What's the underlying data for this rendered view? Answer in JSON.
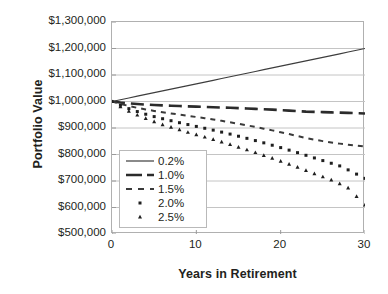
{
  "chart_data": {
    "type": "line",
    "title": "",
    "xlabel": "Years in Retirement",
    "ylabel": "Portfolio Value",
    "xlim": [
      0,
      30
    ],
    "ylim": [
      500000,
      1300000
    ],
    "xticks": [
      "0",
      "10",
      "20",
      "30"
    ],
    "xtick_values": [
      0,
      10,
      20,
      30
    ],
    "yticks": [
      "$500,000",
      "$600,000",
      "$700,000",
      "$800,000",
      "$900,000",
      "$1,000,000",
      "$1,100,000",
      "$1,200,000",
      "$1,300,000"
    ],
    "ytick_values": [
      500000,
      600000,
      700000,
      800000,
      900000,
      1000000,
      1100000,
      1200000,
      1300000
    ],
    "grid": "horizontal",
    "legend_position": "lower-left-inside",
    "x": [
      0,
      1,
      2,
      3,
      4,
      5,
      6,
      7,
      8,
      9,
      10,
      11,
      12,
      13,
      14,
      15,
      16,
      17,
      18,
      19,
      20,
      21,
      22,
      23,
      24,
      25,
      26,
      27,
      28,
      29,
      30
    ],
    "series": [
      {
        "name": "0.2%",
        "style": "solid",
        "color": "#3d3d3d",
        "start_value": 1000000,
        "end_value": 1200000,
        "values": [
          1000000,
          1006700,
          1013300,
          1020000,
          1026700,
          1033300,
          1040000,
          1046700,
          1053300,
          1060000,
          1066700,
          1073300,
          1080000,
          1086700,
          1093300,
          1100000,
          1106700,
          1113300,
          1120000,
          1126700,
          1133300,
          1140000,
          1146700,
          1153300,
          1160000,
          1166700,
          1173300,
          1180000,
          1186700,
          1193300,
          1200000
        ]
      },
      {
        "name": "1.0%",
        "style": "long-dash",
        "color": "#2b2b2b",
        "start_value": 1000000,
        "end_value": 955000,
        "values": [
          1000000,
          996000,
          993000,
          990500,
          988500,
          986800,
          985300,
          984000,
          982800,
          981700,
          980600,
          979500,
          978400,
          977300,
          976200,
          975000,
          973700,
          972300,
          970800,
          969200,
          967500,
          965700,
          963800,
          961800,
          961000,
          960000,
          959000,
          958000,
          957000,
          956000,
          955000
        ]
      },
      {
        "name": "1.5%",
        "style": "short-dash",
        "color": "#3a3a3a",
        "start_value": 1000000,
        "end_value": 830000,
        "values": [
          1000000,
          991000,
          983000,
          976000,
          970000,
          964500,
          959500,
          955000,
          950500,
          946000,
          941500,
          937000,
          932000,
          927000,
          921500,
          916000,
          910000,
          904000,
          897500,
          891000,
          884000,
          877000,
          869500,
          862000,
          856000,
          850500,
          845500,
          841000,
          837000,
          833500,
          830000
        ]
      },
      {
        "name": "2.0%",
        "style": "dotted-square",
        "color": "#1f1f1f",
        "start_value": 1000000,
        "end_value": 710000,
        "values": [
          1000000,
          986000,
          973000,
          962000,
          952000,
          943000,
          935000,
          927500,
          920000,
          913000,
          906000,
          899000,
          892000,
          884500,
          877000,
          869000,
          861000,
          852500,
          844000,
          835000,
          826000,
          816500,
          807000,
          797000,
          787000,
          777000,
          767000,
          757000,
          742000,
          726000,
          710000
        ]
      },
      {
        "name": "2.5%",
        "style": "dotted-triangle",
        "color": "#1f1f1f",
        "start_value": 1000000,
        "end_value": 610000,
        "values": [
          1000000,
          981000,
          964000,
          949000,
          936000,
          924000,
          913000,
          903000,
          893500,
          884000,
          875000,
          866000,
          857000,
          847500,
          838000,
          828000,
          818000,
          807500,
          797000,
          786000,
          775000,
          763500,
          752000,
          740000,
          728000,
          716000,
          704000,
          690000,
          674000,
          642000,
          610000
        ]
      }
    ]
  }
}
